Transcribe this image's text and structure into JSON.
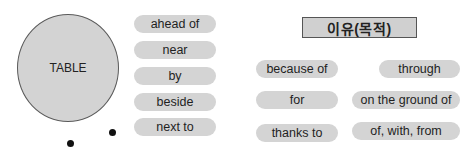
{
  "circle": {
    "label": "TABLE"
  },
  "location_prepositions": [
    {
      "label": "ahead of"
    },
    {
      "label": "near"
    },
    {
      "label": "by"
    },
    {
      "label": "beside"
    },
    {
      "label": "next to"
    }
  ],
  "reason_section": {
    "title": "이유(목적)",
    "left_column": [
      {
        "label": "because of"
      },
      {
        "label": "for"
      },
      {
        "label": "thanks to"
      }
    ],
    "right_column": [
      {
        "label": "through"
      },
      {
        "label": "on the ground of"
      },
      {
        "label": "of, with, from"
      }
    ]
  },
  "colors": {
    "pill_fill": "#d4d4d4",
    "circle_fill": "#d3d3d3",
    "border": "#555555",
    "dot": "#111111"
  }
}
